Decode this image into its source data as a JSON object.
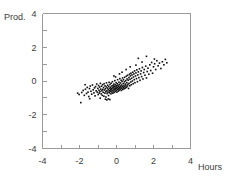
{
  "chart_data": {
    "type": "scatter",
    "title": "",
    "subtitle": "",
    "xlabel": "Hours",
    "ylabel": "Prod.",
    "xlim": [
      -4,
      4
    ],
    "ylim": [
      -4,
      4
    ],
    "grid": false,
    "legend": null,
    "marker": {
      "shape": "square",
      "color": "#0d0d0d",
      "size_px": 1.6
    },
    "x_ticks": [
      -4,
      -3,
      -2,
      -1,
      0,
      1,
      2,
      3,
      4
    ],
    "y_ticks": [
      -4,
      -3,
      -2,
      -1,
      0,
      1,
      2,
      3,
      4
    ],
    "x_tick_labels": [
      "-4",
      "",
      "-2",
      "",
      "0",
      "",
      "2",
      "",
      "4"
    ],
    "y_tick_labels": [
      "-4",
      "",
      "-2",
      "",
      "0",
      "",
      "2",
      "",
      "4"
    ],
    "n_points": 202,
    "correlation": 0.82,
    "points": [
      [
        -2.1,
        -0.72
      ],
      [
        -2.02,
        -0.8
      ],
      [
        -1.93,
        -1.28
      ],
      [
        -1.88,
        -0.68
      ],
      [
        -1.8,
        -0.56
      ],
      [
        -1.74,
        -0.85
      ],
      [
        -1.68,
        -0.49
      ],
      [
        -1.62,
        -0.74
      ],
      [
        -1.58,
        -0.38
      ],
      [
        -1.54,
        -0.66
      ],
      [
        -1.5,
        -0.92
      ],
      [
        -1.46,
        -0.45
      ],
      [
        -1.42,
        -0.3
      ],
      [
        -1.38,
        -0.61
      ],
      [
        -1.34,
        -0.78
      ],
      [
        -1.3,
        -0.24
      ],
      [
        -1.26,
        -0.52
      ],
      [
        -1.22,
        -0.7
      ],
      [
        -1.19,
        -0.41
      ],
      [
        -1.16,
        -0.88
      ],
      [
        -1.13,
        -0.33
      ],
      [
        -1.1,
        -0.58
      ],
      [
        -1.07,
        -0.18
      ],
      [
        -1.04,
        -0.66
      ],
      [
        -1.01,
        -0.44
      ],
      [
        -0.99,
        -0.8
      ],
      [
        -0.97,
        -0.27
      ],
      [
        -0.95,
        -0.55
      ],
      [
        -0.93,
        -0.71
      ],
      [
        -0.91,
        -0.36
      ],
      [
        -0.89,
        -0.62
      ],
      [
        -0.87,
        -0.14
      ],
      [
        -0.85,
        -0.48
      ],
      [
        -0.83,
        -0.76
      ],
      [
        -0.81,
        -0.31
      ],
      [
        -0.79,
        -0.58
      ],
      [
        -0.77,
        -0.85
      ],
      [
        -0.75,
        -0.22
      ],
      [
        -0.74,
        -0.5
      ],
      [
        -0.72,
        -0.67
      ],
      [
        -0.7,
        -0.39
      ],
      [
        -0.68,
        -0.9
      ],
      [
        -0.67,
        -0.16
      ],
      [
        -0.65,
        -0.54
      ],
      [
        -0.63,
        -0.72
      ],
      [
        -0.62,
        -0.29
      ],
      [
        -0.6,
        -0.46
      ],
      [
        -0.58,
        -0.63
      ],
      [
        -0.57,
        -0.95
      ],
      [
        -0.55,
        -0.35
      ],
      [
        -0.54,
        -0.11
      ],
      [
        -0.52,
        -0.58
      ],
      [
        -0.51,
        -0.74
      ],
      [
        -0.49,
        -0.42
      ],
      [
        -0.48,
        -0.25
      ],
      [
        -0.46,
        -0.66
      ],
      [
        -0.45,
        -0.5
      ],
      [
        -0.43,
        -0.86
      ],
      [
        -0.42,
        -0.33
      ],
      [
        -0.4,
        -0.08
      ],
      [
        -0.39,
        -0.57
      ],
      [
        -0.38,
        -0.7
      ],
      [
        -0.36,
        -0.44
      ],
      [
        -0.35,
        -0.21
      ],
      [
        -0.34,
        -0.61
      ],
      [
        -0.32,
        -0.37
      ],
      [
        -0.31,
        -0.52
      ],
      [
        -0.3,
        -0.76
      ],
      [
        -0.29,
        -0.13
      ],
      [
        -0.27,
        -0.46
      ],
      [
        -0.26,
        -0.65
      ],
      [
        -0.25,
        -0.3
      ],
      [
        -0.24,
        -0.55
      ],
      [
        -0.22,
        -0.04
      ],
      [
        -0.21,
        -0.41
      ],
      [
        -0.2,
        -0.72
      ],
      [
        -0.19,
        -0.26
      ],
      [
        -0.18,
        -0.59
      ],
      [
        -0.16,
        -0.36
      ],
      [
        -0.15,
        -0.48
      ],
      [
        -0.14,
        -0.18
      ],
      [
        -0.13,
        -0.68
      ],
      [
        -0.12,
        -0.31
      ],
      [
        -0.1,
        -0.53
      ],
      [
        -0.09,
        0.02
      ],
      [
        -0.08,
        -0.42
      ],
      [
        -0.07,
        -0.62
      ],
      [
        -0.06,
        -0.23
      ],
      [
        -0.05,
        -0.47
      ],
      [
        -0.03,
        -0.35
      ],
      [
        -0.02,
        -0.1
      ],
      [
        -0.01,
        -0.56
      ],
      [
        0.0,
        -0.28
      ],
      [
        0.01,
        -0.44
      ],
      [
        0.02,
        -0.66
      ],
      [
        0.04,
        -0.16
      ],
      [
        0.05,
        -0.38
      ],
      [
        0.06,
        0.08
      ],
      [
        0.07,
        -0.5
      ],
      [
        0.08,
        -0.25
      ],
      [
        0.1,
        -0.6
      ],
      [
        0.11,
        -0.33
      ],
      [
        0.12,
        -0.45
      ],
      [
        0.13,
        -0.07
      ],
      [
        0.15,
        -0.54
      ],
      [
        0.16,
        -0.2
      ],
      [
        0.17,
        -0.4
      ],
      [
        0.18,
        0.14
      ],
      [
        0.2,
        -0.3
      ],
      [
        0.21,
        -0.48
      ],
      [
        0.22,
        -0.12
      ],
      [
        0.24,
        -0.36
      ],
      [
        0.25,
        0.04
      ],
      [
        0.26,
        -0.56
      ],
      [
        0.28,
        -0.24
      ],
      [
        0.29,
        -0.43
      ],
      [
        0.3,
        -0.02
      ],
      [
        0.32,
        -0.32
      ],
      [
        0.33,
        0.18
      ],
      [
        0.34,
        -0.5
      ],
      [
        0.36,
        -0.15
      ],
      [
        0.37,
        -0.38
      ],
      [
        0.38,
        0.07
      ],
      [
        0.4,
        -0.27
      ],
      [
        0.41,
        -0.46
      ],
      [
        0.43,
        -0.05
      ],
      [
        0.44,
        0.22
      ],
      [
        0.45,
        -0.34
      ],
      [
        0.47,
        -0.18
      ],
      [
        0.48,
        -0.42
      ],
      [
        0.5,
        0.02
      ],
      [
        0.51,
        -0.25
      ],
      [
        0.53,
        0.28
      ],
      [
        0.54,
        -0.37
      ],
      [
        0.56,
        -0.1
      ],
      [
        0.57,
        0.12
      ],
      [
        0.59,
        -0.3
      ],
      [
        0.6,
        0.34
      ],
      [
        0.62,
        -0.2
      ],
      [
        0.63,
        0.05
      ],
      [
        0.65,
        -0.44
      ],
      [
        0.67,
        0.2
      ],
      [
        0.68,
        -0.14
      ],
      [
        0.7,
        0.4
      ],
      [
        0.72,
        -0.28
      ],
      [
        0.73,
        0.1
      ],
      [
        0.75,
        0.3
      ],
      [
        0.77,
        -0.06
      ],
      [
        0.78,
        0.46
      ],
      [
        0.8,
        -0.22
      ],
      [
        0.82,
        0.16
      ],
      [
        0.84,
        0.36
      ],
      [
        0.86,
        0.0
      ],
      [
        0.88,
        0.52
      ],
      [
        0.9,
        -0.16
      ],
      [
        0.92,
        0.24
      ],
      [
        0.94,
        0.42
      ],
      [
        0.96,
        0.08
      ],
      [
        0.98,
        0.6
      ],
      [
        1.0,
        -0.1
      ],
      [
        1.03,
        0.3
      ],
      [
        1.05,
        0.48
      ],
      [
        1.08,
        0.14
      ],
      [
        1.1,
        0.66
      ],
      [
        1.13,
        -0.04
      ],
      [
        1.15,
        0.36
      ],
      [
        1.18,
        0.54
      ],
      [
        1.21,
        0.2
      ],
      [
        1.24,
        0.72
      ],
      [
        1.27,
        0.04
      ],
      [
        1.3,
        0.42
      ],
      [
        1.33,
        0.6
      ],
      [
        1.36,
        0.26
      ],
      [
        1.4,
        0.8
      ],
      [
        1.43,
        0.12
      ],
      [
        1.47,
        0.5
      ],
      [
        1.5,
        0.68
      ],
      [
        1.54,
        0.34
      ],
      [
        1.58,
        0.88
      ],
      [
        1.62,
        0.18
      ],
      [
        1.66,
        0.56
      ],
      [
        1.7,
        0.76
      ],
      [
        1.75,
        0.4
      ],
      [
        1.8,
        0.96
      ],
      [
        1.85,
        0.62
      ],
      [
        1.9,
        1.1
      ],
      [
        1.95,
        0.46
      ],
      [
        2.0,
        0.84
      ],
      [
        2.06,
        1.02
      ],
      [
        2.12,
        0.68
      ],
      [
        2.18,
        1.2
      ],
      [
        2.25,
        0.9
      ],
      [
        2.32,
        1.06
      ],
      [
        2.4,
        0.74
      ],
      [
        2.48,
        1.14
      ],
      [
        2.56,
        0.96
      ],
      [
        2.64,
        1.28
      ],
      [
        2.72,
        1.08
      ],
      [
        -1.7,
        -0.22
      ],
      [
        -1.45,
        -1.05
      ],
      [
        -0.88,
        -1.02
      ],
      [
        -0.6,
        -1.08
      ],
      [
        -0.52,
        -1.12
      ],
      [
        -0.44,
        -1.06
      ],
      [
        -0.36,
        -1.1
      ],
      [
        1.18,
        1.34
      ],
      [
        1.62,
        1.46
      ],
      [
        2.05,
        1.3
      ],
      [
        0.52,
        0.68
      ],
      [
        0.3,
        0.52
      ],
      [
        -0.14,
        0.3
      ],
      [
        0.74,
        0.84
      ],
      [
        1.05,
        0.94
      ],
      [
        1.38,
        1.12
      ],
      [
        0.16,
        0.42
      ],
      [
        -0.05,
        0.24
      ]
    ]
  }
}
